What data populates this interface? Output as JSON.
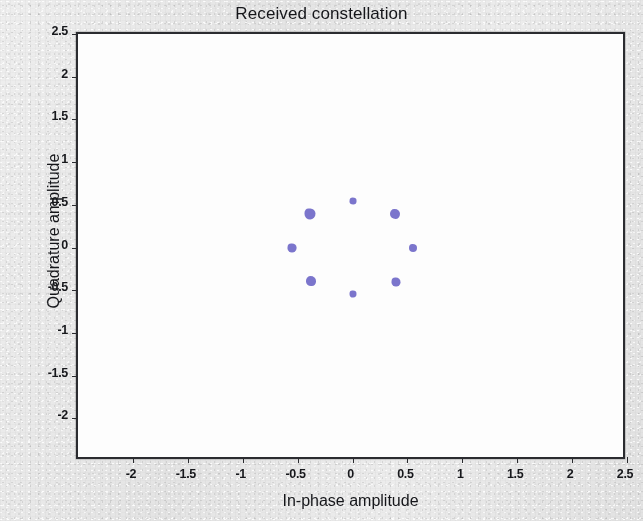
{
  "figure": {
    "title": "Received constellation",
    "background_color": "#e7e7e7",
    "plot_background_color": "#fdfdfd",
    "axis_color": "#2b2c30"
  },
  "chart_data": {
    "type": "scatter",
    "title": "Received constellation",
    "xlabel": "In-phase amplitude",
    "ylabel": "Quadrature amplitude",
    "xlim": [
      -2.5,
      2.5
    ],
    "ylim": [
      -2.5,
      2.5
    ],
    "xticks": [
      -2,
      -1.5,
      -1,
      -0.5,
      0,
      0.5,
      1,
      1.5,
      2,
      2.5
    ],
    "yticks": [
      -2,
      -1.5,
      -1,
      -0.5,
      0,
      0.5,
      1,
      1.5,
      2,
      2.5
    ],
    "xtick_labels": [
      "-2",
      "-1.5",
      "-1",
      "-0.5",
      "0",
      "0.5",
      "1",
      "1.5",
      "2",
      "2.5"
    ],
    "ytick_labels": [
      "-2",
      "-1.5",
      "-1",
      "-0.5",
      "0",
      "0.5",
      "1",
      "1.5",
      "2",
      "2.5"
    ],
    "grid": false,
    "legend": false,
    "marker_color": "#7b75cc",
    "marker_size": 9,
    "modulation": "8-PSK",
    "ring_radius": 0.55,
    "series": [
      {
        "name": "Received symbols",
        "color": "#7b75cc",
        "x": [
          0.55,
          0.39,
          0.0,
          -0.39,
          -0.55,
          -0.38,
          0.0,
          0.4
        ],
        "y": [
          0.0,
          0.39,
          0.55,
          0.39,
          0.0,
          -0.39,
          -0.55,
          -0.4
        ]
      }
    ],
    "points": [
      {
        "label": "S0",
        "x": 0.55,
        "y": 0.0,
        "size": 8
      },
      {
        "label": "S1",
        "x": 0.39,
        "y": 0.39,
        "size": 10
      },
      {
        "label": "S2",
        "x": 0.0,
        "y": 0.55,
        "size": 7
      },
      {
        "label": "S3",
        "x": -0.39,
        "y": 0.39,
        "size": 11
      },
      {
        "label": "S4",
        "x": -0.55,
        "y": 0.0,
        "size": 9
      },
      {
        "label": "S5",
        "x": -0.38,
        "y": -0.39,
        "size": 10
      },
      {
        "label": "S6",
        "x": 0.0,
        "y": -0.55,
        "size": 7
      },
      {
        "label": "S7",
        "x": 0.4,
        "y": -0.4,
        "size": 9
      }
    ]
  }
}
